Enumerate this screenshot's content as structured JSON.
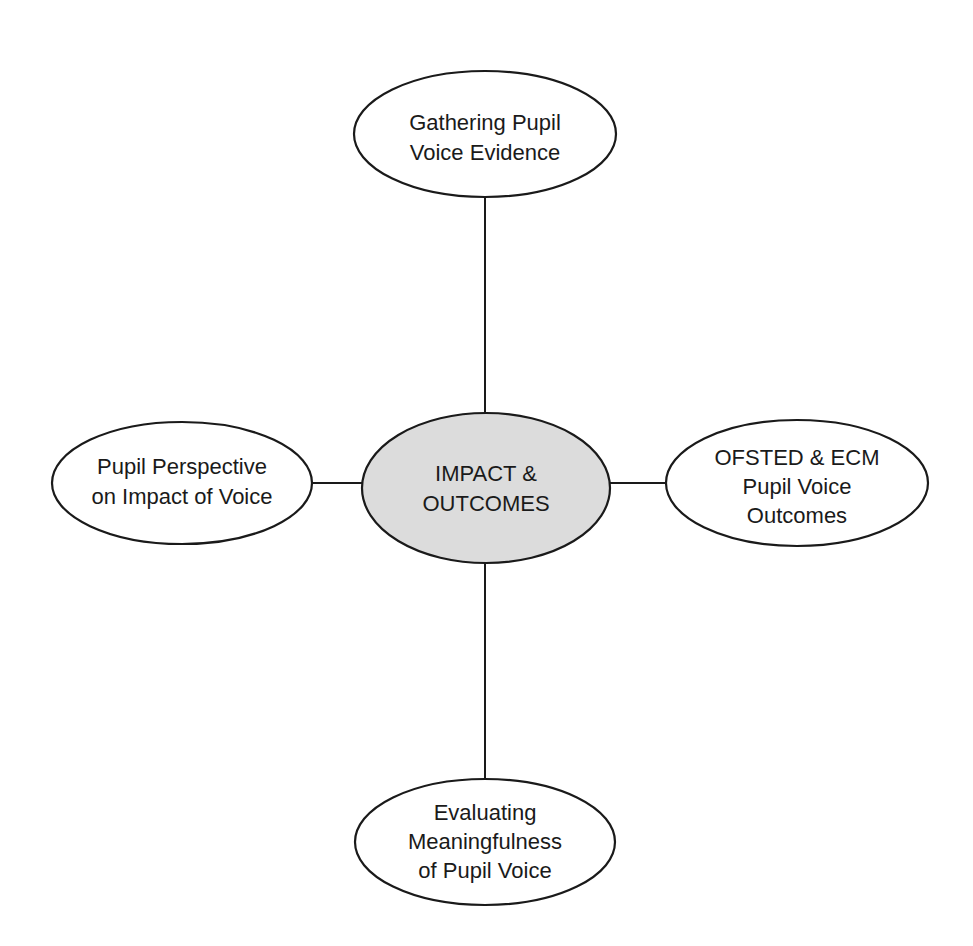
{
  "diagram": {
    "type": "hub-and-spoke",
    "center": {
      "lines": [
        "IMPACT &",
        "OUTCOMES"
      ],
      "fill": "#dcdcdc"
    },
    "nodes": {
      "top": {
        "lines": [
          "Gathering Pupil",
          "Voice Evidence"
        ]
      },
      "left": {
        "lines": [
          "Pupil Perspective",
          "on Impact of Voice"
        ]
      },
      "right": {
        "lines": [
          "OFSTED & ECM",
          "Pupil Voice",
          "Outcomes"
        ]
      },
      "bottom": {
        "lines": [
          "Evaluating",
          "Meaningfulness",
          "of Pupil Voice"
        ]
      }
    },
    "edges": [
      [
        "center",
        "top"
      ],
      [
        "center",
        "left"
      ],
      [
        "center",
        "right"
      ],
      [
        "center",
        "bottom"
      ]
    ],
    "colors": {
      "stroke": "#1a1a1a",
      "node_fill": "#ffffff",
      "center_fill": "#dcdcdc",
      "background": "#ffffff"
    }
  }
}
